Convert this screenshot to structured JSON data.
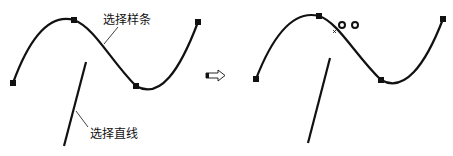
{
  "labels": {
    "spline": "选择样条",
    "line": "选择直线"
  },
  "colors": {
    "stroke": "#111111",
    "background": "#ffffff"
  },
  "icons": {
    "arrow": "hollow-right-arrow",
    "markers": "two-small-circles"
  }
}
